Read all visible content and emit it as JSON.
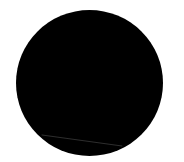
{
  "canvas": {
    "width": 184,
    "height": 162,
    "background": "#ffffff"
  },
  "shape": {
    "type": "circle",
    "fill": "#000000",
    "center_x": 89.5,
    "center_y": 83,
    "diameter_x": 147,
    "diameter_y": 146
  },
  "highlight_line": {
    "x1": 42,
    "y1": 135,
    "x2": 122,
    "y2": 146,
    "color": "#3a3a3a"
  }
}
